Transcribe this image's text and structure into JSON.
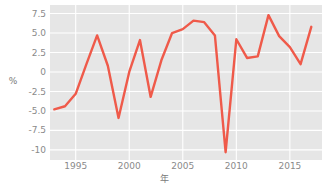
{
  "chart_data": {
    "type": "line",
    "title": "",
    "subtitle": "",
    "xlabel": "年",
    "ylabel": "%",
    "x": [
      1993,
      1994,
      1995,
      1996,
      1997,
      1998,
      1999,
      2000,
      2001,
      2002,
      2003,
      2004,
      2005,
      2006,
      2007,
      2008,
      2009,
      2010,
      2011,
      2012,
      2013,
      2014,
      2015,
      2016,
      2017
    ],
    "values": [
      -4.8,
      -4.4,
      -2.8,
      1.0,
      4.7,
      0.8,
      -5.9,
      0.0,
      4.1,
      -3.2,
      1.5,
      5.0,
      5.5,
      6.6,
      6.4,
      4.7,
      -10.3,
      4.2,
      1.8,
      2.0,
      7.3,
      4.6,
      3.2,
      1.0,
      5.8
    ],
    "series": [
      {
        "name": "",
        "color": "#ef5a4a",
        "values": [
          -4.8,
          -4.4,
          -2.8,
          1.0,
          4.7,
          0.8,
          -5.9,
          0.0,
          4.1,
          -3.2,
          1.5,
          5.0,
          5.5,
          6.6,
          6.4,
          4.7,
          -10.3,
          4.2,
          1.8,
          2.0,
          7.3,
          4.6,
          3.2,
          1.0,
          5.8
        ]
      }
    ],
    "xlim": [
      1992.6,
      1918.0
    ],
    "ylim": [
      -11.3,
      8.6
    ],
    "xticks": [
      1995,
      2000,
      2005,
      2010,
      2015
    ],
    "xticklabels": [
      "1995",
      "2000",
      "2005",
      "2010",
      "2015"
    ],
    "yticks": [
      7.5,
      5.0,
      2.5,
      0,
      -2.5,
      -5.0,
      -7.5,
      -10
    ],
    "yticklabels": [
      "7.5",
      "5.0",
      "2.5",
      "0",
      "-2.5",
      "-5.0",
      "-7.5",
      "-10"
    ],
    "grid": true,
    "grid_color": "#ffffff",
    "plot_background": "#e6e6e6",
    "figure_background": "#ffffff",
    "legend": false,
    "legend_position": "none",
    "line_width": 2.4,
    "markers": false,
    "annotations": []
  }
}
